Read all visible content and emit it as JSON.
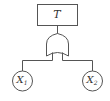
{
  "diagram": {
    "type": "fault-tree",
    "top_event": {
      "label": "T"
    },
    "gate": {
      "type": "OR"
    },
    "basic_events": [
      {
        "label": "X",
        "subscript": "1"
      },
      {
        "label": "X",
        "subscript": "2"
      }
    ],
    "colors": {
      "stroke": "#555555",
      "background": "#ffffff",
      "text": "#333333"
    }
  }
}
